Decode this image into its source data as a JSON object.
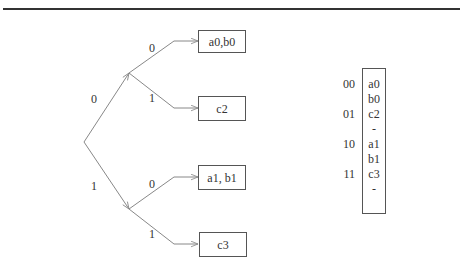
{
  "tree": {
    "root_edges": [
      {
        "label": "0"
      },
      {
        "label": "1"
      }
    ],
    "leaf_edges": [
      {
        "label": "0"
      },
      {
        "label": "1"
      },
      {
        "label": "0"
      },
      {
        "label": "1"
      }
    ],
    "leaves": [
      {
        "text": "a0,b0"
      },
      {
        "text": "c2"
      },
      {
        "text": "a1, b1"
      },
      {
        "text": "c3"
      }
    ]
  },
  "table": {
    "keys": [
      "00",
      "01",
      "10",
      "11"
    ],
    "cells": [
      "a0",
      "b0",
      "c2",
      "-",
      "a1",
      "b1",
      "c3",
      "-"
    ]
  }
}
